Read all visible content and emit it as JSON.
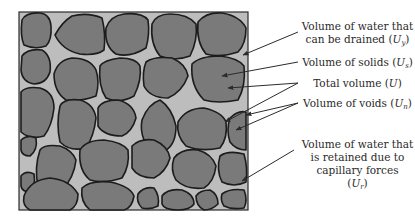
{
  "diagram": {
    "colors": {
      "background": "#ffffff",
      "pore_fill": "#bdbdbd",
      "grain_fill": "#7a7a7a",
      "grain_outline": "#1c1c1c",
      "box_border": "#2b2b2b",
      "arrow": "#2b2b2b",
      "text": "#2a2a2a"
    },
    "labels": [
      {
        "id": "drainable-water",
        "line1": "Volume of water that",
        "line2_prefix": "can be drained (",
        "symbol": "U",
        "subscript": "y",
        "suffix": ")"
      },
      {
        "id": "solids",
        "prefix": "Volume of solids (",
        "symbol": "U",
        "subscript": "s",
        "suffix": ")"
      },
      {
        "id": "total",
        "prefix": "Total volume (",
        "symbol": "U",
        "subscript": "",
        "suffix": ")"
      },
      {
        "id": "voids",
        "prefix": "Volume of voids (",
        "symbol": "U",
        "subscript": "n",
        "suffix": ")"
      },
      {
        "id": "retained-water",
        "line1": "Volume of water that",
        "line2": "is retained due to",
        "line3": "capillary forces",
        "line4_prefix": "(",
        "symbol": "U",
        "subscript": "r",
        "suffix": ")"
      }
    ]
  }
}
